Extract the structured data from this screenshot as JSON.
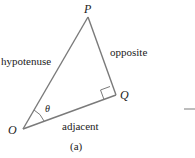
{
  "diagram": {
    "vertices": {
      "P": "P",
      "Q": "Q",
      "O": "O"
    },
    "angle_label": "θ",
    "sides": {
      "hypotenuse": "hypotenuse",
      "opposite": "opposite",
      "adjacent": "adjacent"
    },
    "caption": "(a)",
    "colors": {
      "line": "#7a7a7a",
      "text": "#222222"
    }
  }
}
